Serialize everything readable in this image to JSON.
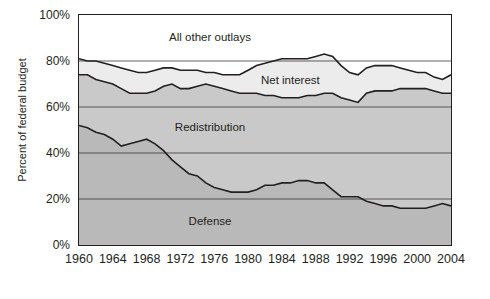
{
  "chart_data": {
    "type": "area",
    "title": "",
    "xlabel": "",
    "ylabel": "Percent of federal budget",
    "xlim": [
      1960,
      2004
    ],
    "ylim": [
      0,
      100
    ],
    "grid": true,
    "legend_position": "inline-labels",
    "y_ticks": [
      "0%",
      "20%",
      "40%",
      "60%",
      "80%",
      "100%"
    ],
    "y_tick_values": [
      0,
      20,
      40,
      60,
      80,
      100
    ],
    "x_ticks": [
      "1960",
      "1964",
      "1968",
      "1972",
      "1976",
      "1980",
      "1984",
      "1988",
      "1992",
      "1996",
      "2000",
      "2004"
    ],
    "x_tick_values": [
      1960,
      1964,
      1968,
      1972,
      1976,
      1980,
      1984,
      1988,
      1992,
      1996,
      2000,
      2004
    ],
    "x": [
      1960,
      1961,
      1962,
      1963,
      1964,
      1965,
      1966,
      1967,
      1968,
      1969,
      1970,
      1971,
      1972,
      1973,
      1974,
      1975,
      1976,
      1977,
      1978,
      1979,
      1980,
      1981,
      1982,
      1983,
      1984,
      1985,
      1986,
      1987,
      1988,
      1989,
      1990,
      1991,
      1992,
      1993,
      1994,
      1995,
      1996,
      1997,
      1998,
      1999,
      2000,
      2001,
      2002,
      2003,
      2004
    ],
    "series": [
      {
        "name": "Defense",
        "color": "#b9b9b9",
        "values": [
          52,
          51,
          49,
          48,
          46,
          43,
          44,
          45,
          46,
          44,
          41,
          37,
          34,
          31,
          30,
          27,
          25,
          24,
          23,
          23,
          23,
          24,
          26,
          26,
          27,
          27,
          28,
          28,
          27,
          27,
          24,
          21,
          21,
          21,
          19,
          18,
          17,
          17,
          16,
          16,
          16,
          16,
          17,
          18,
          17
        ]
      },
      {
        "name": "Redistribution",
        "color": "#c9c9c9",
        "values": [
          74,
          74,
          72,
          71,
          70,
          68,
          66,
          66,
          66,
          67,
          69,
          70,
          68,
          68,
          69,
          70,
          69,
          68,
          67,
          66,
          66,
          66,
          65,
          65,
          64,
          64,
          64,
          65,
          65,
          66,
          66,
          64,
          63,
          62,
          66,
          67,
          67,
          67,
          68,
          68,
          68,
          68,
          67,
          66,
          66
        ]
      },
      {
        "name": "Net interest",
        "color": "#ececec",
        "values": [
          81,
          80,
          80,
          79,
          78,
          77,
          76,
          75,
          75,
          76,
          77,
          77,
          76,
          76,
          76,
          75,
          75,
          74,
          74,
          74,
          76,
          78,
          79,
          80,
          81,
          81,
          81,
          81,
          82,
          83,
          82,
          78,
          75,
          74,
          77,
          78,
          78,
          78,
          77,
          76,
          75,
          75,
          73,
          72,
          74
        ]
      },
      {
        "name": "All other outlays",
        "color": "#ffffff",
        "values": [
          100,
          100,
          100,
          100,
          100,
          100,
          100,
          100,
          100,
          100,
          100,
          100,
          100,
          100,
          100,
          100,
          100,
          100,
          100,
          100,
          100,
          100,
          100,
          100,
          100,
          100,
          100,
          100,
          100,
          100,
          100,
          100,
          100,
          100,
          100,
          100,
          100,
          100,
          100,
          100,
          100,
          100,
          100,
          100,
          100
        ]
      }
    ],
    "annotations": [
      {
        "text": "All other outlays",
        "x": 1975.5,
        "y": 90
      },
      {
        "text": "Net interest",
        "x": 1985.0,
        "y": 71.5
      },
      {
        "text": "Redistribution",
        "x": 1975.5,
        "y": 51
      },
      {
        "text": "Defense",
        "x": 1975.5,
        "y": 10
      }
    ]
  }
}
